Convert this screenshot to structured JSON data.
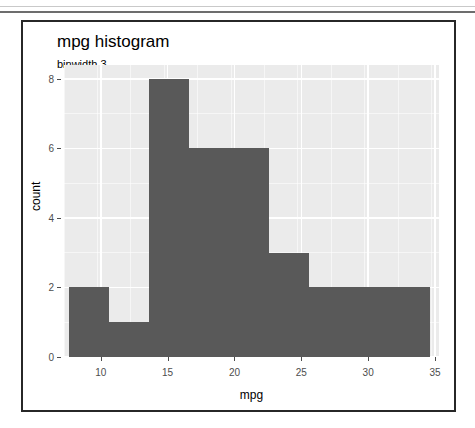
{
  "window": {
    "background_color": "#ffffff",
    "card_border_color": "#272727"
  },
  "chart_data": {
    "type": "bar",
    "title": "mpg histogram",
    "subtitle": "binwidth 3",
    "xlabel": "mpg",
    "ylabel": "count",
    "xlim": [
      7.25,
      35.3
    ],
    "ylim": [
      0,
      8.4
    ],
    "xticks": [
      10,
      15,
      20,
      25,
      30,
      35
    ],
    "ytick_labels": [
      "0",
      "2",
      "4",
      "6",
      "8"
    ],
    "yticks": [
      0,
      2,
      4,
      6,
      8
    ],
    "grid": true,
    "legend": "none",
    "binwidth": 3,
    "panel_color": "#ebebeb",
    "bar_color": "#595959",
    "bins": [
      {
        "x0": 7.6,
        "x1": 10.6,
        "count": 2
      },
      {
        "x0": 10.6,
        "x1": 13.6,
        "count": 1
      },
      {
        "x0": 13.6,
        "x1": 16.6,
        "count": 8
      },
      {
        "x0": 16.6,
        "x1": 19.6,
        "count": 6
      },
      {
        "x0": 19.6,
        "x1": 22.6,
        "count": 6
      },
      {
        "x0": 22.6,
        "x1": 25.6,
        "count": 3
      },
      {
        "x0": 25.6,
        "x1": 28.6,
        "count": 2
      },
      {
        "x0": 28.6,
        "x1": 31.6,
        "count": 2
      },
      {
        "x0": 31.6,
        "x1": 34.6,
        "count": 2
      }
    ],
    "categories": [
      "7.6-10.6",
      "10.6-13.6",
      "13.6-16.6",
      "16.6-19.6",
      "19.6-22.6",
      "22.6-25.6",
      "25.6-28.6",
      "28.6-31.6",
      "31.6-34.6"
    ],
    "values": [
      2,
      1,
      8,
      6,
      6,
      3,
      2,
      2,
      2
    ]
  }
}
